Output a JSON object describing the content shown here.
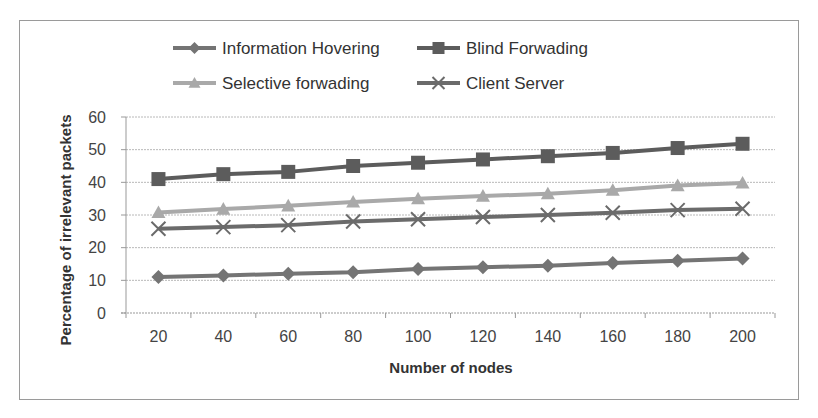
{
  "chart_data": {
    "type": "line",
    "title": "",
    "xlabel": "Number of nodes",
    "ylabel": "Percentage of irrelevant packets",
    "categories": [
      "20",
      "40",
      "60",
      "80",
      "100",
      "120",
      "140",
      "160",
      "180",
      "200"
    ],
    "ylim": [
      0,
      60
    ],
    "yticks": [
      0,
      10,
      20,
      30,
      40,
      50,
      60
    ],
    "grid": true,
    "legend_position": "top",
    "series": [
      {
        "name": "Information Hovering",
        "marker": "diamond",
        "color": "#747474",
        "values": [
          11,
          11.5,
          12,
          12.5,
          13.5,
          14,
          14.5,
          15.3,
          16,
          16.7
        ]
      },
      {
        "name": "Blind Forwading",
        "marker": "square",
        "color": "#5c5c5c",
        "values": [
          41,
          42.5,
          43.2,
          45,
          46,
          47,
          48,
          49,
          50.5,
          51.8
        ]
      },
      {
        "name": "Selective forwading",
        "marker": "triangle",
        "color": "#a9a9a9",
        "values": [
          30.8,
          31.8,
          32.8,
          34,
          35,
          35.8,
          36.5,
          37.6,
          39,
          39.8
        ]
      },
      {
        "name": "Client Server",
        "marker": "x",
        "color": "#6b6b6b",
        "values": [
          25.8,
          26.3,
          26.9,
          28,
          28.7,
          29.4,
          30,
          30.7,
          31.5,
          31.9
        ]
      }
    ]
  },
  "legend": {
    "items": [
      {
        "label": "Information Hovering"
      },
      {
        "label": "Blind Forwading"
      },
      {
        "label": "Selective forwading"
      },
      {
        "label": "Client Server"
      }
    ]
  },
  "axes": {
    "x_title": "Number of nodes",
    "y_title": "Percentage of irrelevant packets"
  }
}
